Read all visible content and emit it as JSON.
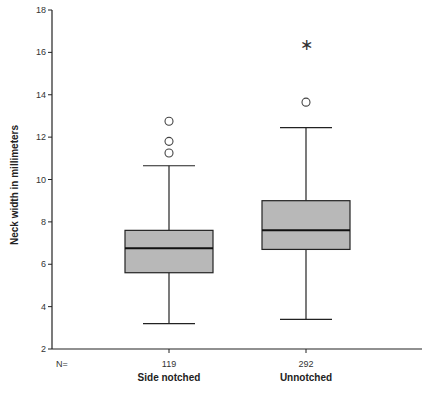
{
  "chart_data": {
    "type": "boxplot",
    "title": "",
    "xlabel": "",
    "ylabel": "Neck width in millimeters",
    "ylim": [
      2,
      18
    ],
    "yticks": [
      2,
      4,
      6,
      8,
      10,
      12,
      14,
      16,
      18
    ],
    "grid": false,
    "legend": null,
    "n_label": "N=",
    "categories": [
      "Side notched",
      "Unnotched"
    ],
    "series": [
      {
        "name": "Side notched",
        "n": "119",
        "whisker_low": 3.2,
        "q1": 5.6,
        "median": 6.75,
        "q3": 7.6,
        "whisker_high": 10.65,
        "outliers": [
          11.25,
          11.8,
          12.75
        ],
        "extremes": []
      },
      {
        "name": "Unnotched",
        "n": "292",
        "whisker_low": 3.4,
        "q1": 6.7,
        "median": 7.6,
        "q3": 9.0,
        "whisker_high": 12.45,
        "outliers": [
          13.65
        ],
        "extremes": [
          16.4
        ]
      }
    ],
    "colors": {
      "box_fill": "#b8b8b8",
      "line": "#222222"
    }
  }
}
